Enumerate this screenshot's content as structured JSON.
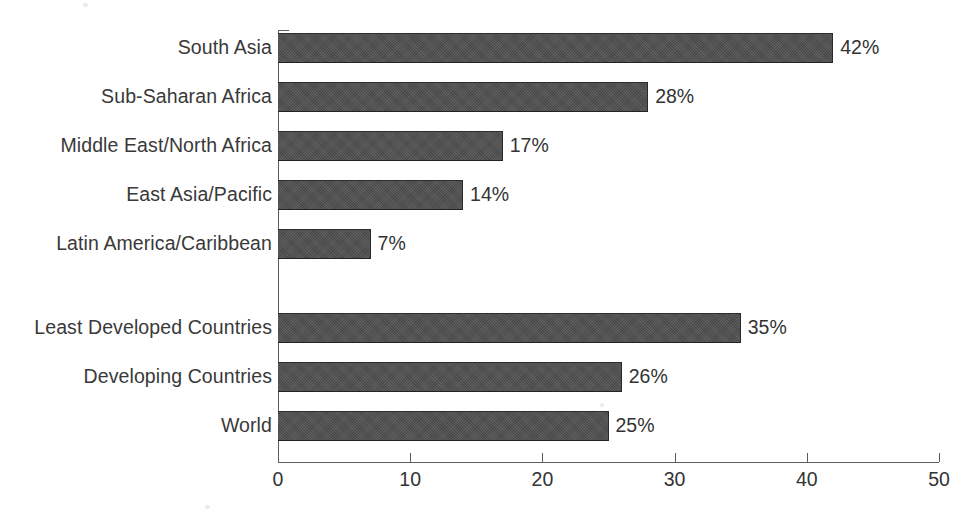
{
  "chart_data": {
    "type": "bar",
    "orientation": "horizontal",
    "title": "",
    "subtitle": "",
    "xlabel": "",
    "ylabel": "",
    "xlim": [
      0,
      50
    ],
    "xticks": [
      0,
      10,
      20,
      30,
      40,
      50
    ],
    "xtick_labels": [
      "0",
      "10",
      "20",
      "30",
      "40",
      "50"
    ],
    "grid": false,
    "legend": null,
    "value_label_suffix": "%",
    "bar_color": "#4e4e4e",
    "text_color": "#333333",
    "axis_color": "#5d5d5d",
    "categories": [
      "South Asia",
      "Sub-Saharan Africa",
      "Middle East/North Africa",
      "East Asia/Pacific",
      "Latin America/Caribbean",
      "Least Developed Countries",
      "Developing Countries",
      "World"
    ],
    "values": [
      42,
      28,
      17,
      14,
      7,
      35,
      26,
      25
    ],
    "data_labels": [
      "42%",
      "28%",
      "17%",
      "14%",
      "7%",
      "35%",
      "26%",
      "25%"
    ],
    "groups": [
      {
        "name": "regions",
        "categories": [
          "South Asia",
          "Sub-Saharan Africa",
          "Middle East/North Africa",
          "East Asia/Pacific",
          "Latin America/Caribbean"
        ],
        "values": [
          42,
          28,
          17,
          14,
          7
        ]
      },
      {
        "name": "aggregates",
        "categories": [
          "Least Developed Countries",
          "Developing Countries",
          "World"
        ],
        "values": [
          35,
          26,
          25
        ]
      }
    ],
    "bars": [
      {
        "category": "South Asia",
        "value": 42,
        "label": "42%",
        "top": 33,
        "height": 30
      },
      {
        "category": "Sub-Saharan Africa",
        "value": 28,
        "label": "28%",
        "top": 82,
        "height": 30
      },
      {
        "category": "Middle East/North Africa",
        "value": 17,
        "label": "17%",
        "top": 131,
        "height": 30
      },
      {
        "category": "East Asia/Pacific",
        "value": 14,
        "label": "14%",
        "top": 180,
        "height": 30
      },
      {
        "category": "Latin America/Caribbean",
        "value": 7,
        "label": "7%",
        "top": 229,
        "height": 30
      },
      {
        "category": "Least Developed Countries",
        "value": 35,
        "label": "35%",
        "top": 313,
        "height": 30
      },
      {
        "category": "Developing Countries",
        "value": 26,
        "label": "26%",
        "top": 362,
        "height": 30
      },
      {
        "category": "World",
        "value": 25,
        "label": "25%",
        "top": 411,
        "height": 30
      }
    ]
  }
}
